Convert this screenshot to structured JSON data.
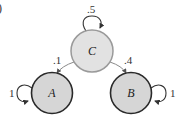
{
  "panel_label": ")",
  "colors": {
    "transient_fill": "#e2e2e2",
    "transient_stroke": "#9a9a9a",
    "absorbing_fill": "#d6d6d6",
    "absorbing_stroke": "#2a2a2a",
    "edge_gray": "#8a8a8a",
    "edge_dark": "#333333"
  },
  "nodes": [
    {
      "id": "C",
      "label": "C",
      "type": "transient",
      "cx": 92,
      "cy": 51,
      "r": 21
    },
    {
      "id": "A",
      "label": "A",
      "type": "absorbing",
      "cx": 52,
      "cy": 93,
      "r": 21
    },
    {
      "id": "B",
      "label": "B",
      "type": "absorbing",
      "cx": 131,
      "cy": 93,
      "r": 21
    }
  ],
  "edges": [
    {
      "from": "C",
      "to": "C",
      "label": ".5"
    },
    {
      "from": "C",
      "to": "A",
      "label": ".1"
    },
    {
      "from": "C",
      "to": "B",
      "label": ".4"
    },
    {
      "from": "A",
      "to": "A",
      "label": "1"
    },
    {
      "from": "B",
      "to": "B",
      "label": "1"
    }
  ]
}
